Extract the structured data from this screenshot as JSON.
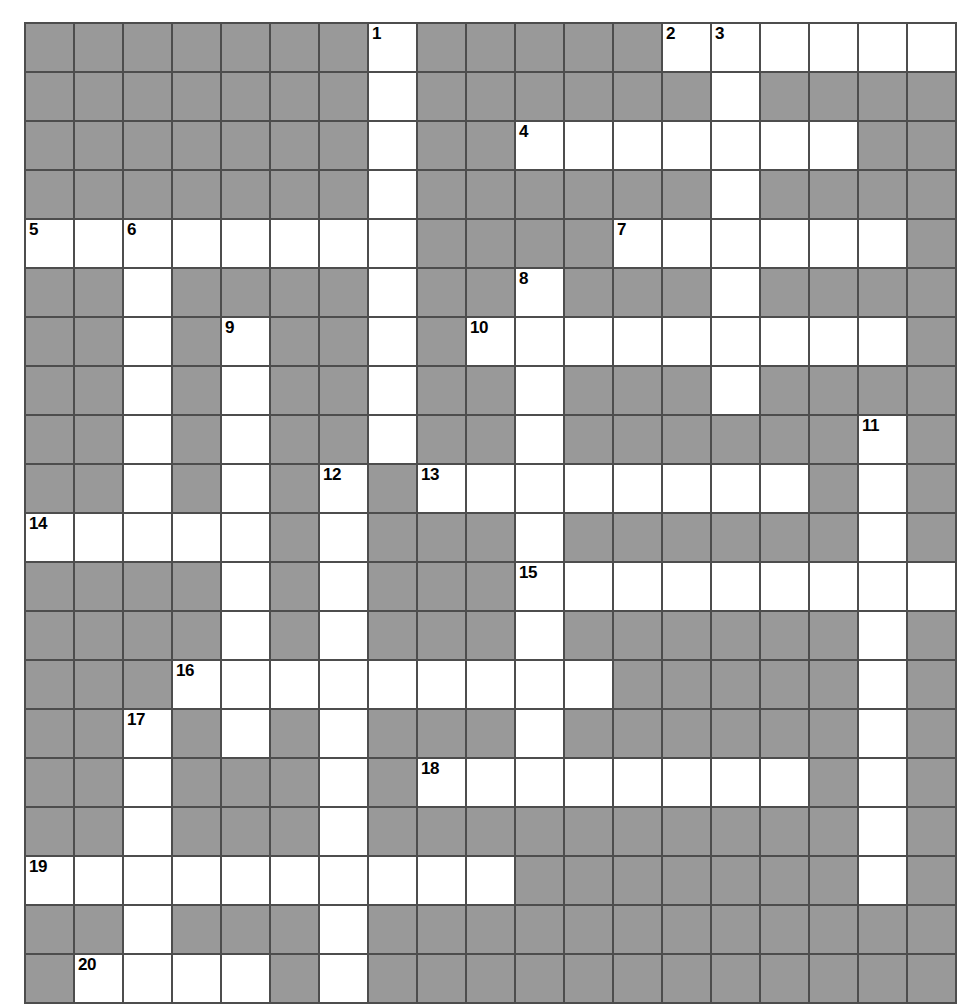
{
  "puzzle": {
    "type": "crossword-grid",
    "title": "Crossword puzzle grid",
    "columns": 19,
    "rows": 20,
    "cell_size": 49,
    "colors": {
      "block": "#999999",
      "open": "#ffffff",
      "grid_line": "#4d4d4d",
      "number": "#000000",
      "page_background": "#ffffff"
    },
    "open_cells": [
      [
        1,
        8
      ],
      [
        1,
        14
      ],
      [
        1,
        15
      ],
      [
        1,
        16
      ],
      [
        1,
        17
      ],
      [
        1,
        18
      ],
      [
        1,
        19
      ],
      [
        2,
        8
      ],
      [
        2,
        15
      ],
      [
        3,
        8
      ],
      [
        3,
        11
      ],
      [
        3,
        12
      ],
      [
        3,
        13
      ],
      [
        3,
        14
      ],
      [
        3,
        15
      ],
      [
        3,
        16
      ],
      [
        3,
        17
      ],
      [
        4,
        8
      ],
      [
        4,
        15
      ],
      [
        5,
        1
      ],
      [
        5,
        2
      ],
      [
        5,
        3
      ],
      [
        5,
        4
      ],
      [
        5,
        5
      ],
      [
        5,
        6
      ],
      [
        5,
        7
      ],
      [
        5,
        8
      ],
      [
        5,
        13
      ],
      [
        5,
        14
      ],
      [
        5,
        15
      ],
      [
        5,
        16
      ],
      [
        5,
        17
      ],
      [
        5,
        18
      ],
      [
        6,
        3
      ],
      [
        6,
        8
      ],
      [
        6,
        11
      ],
      [
        6,
        15
      ],
      [
        7,
        3
      ],
      [
        7,
        5
      ],
      [
        7,
        8
      ],
      [
        7,
        10
      ],
      [
        7,
        11
      ],
      [
        7,
        12
      ],
      [
        7,
        13
      ],
      [
        7,
        14
      ],
      [
        7,
        15
      ],
      [
        7,
        16
      ],
      [
        7,
        17
      ],
      [
        7,
        18
      ],
      [
        8,
        3
      ],
      [
        8,
        5
      ],
      [
        8,
        8
      ],
      [
        8,
        11
      ],
      [
        8,
        15
      ],
      [
        9,
        3
      ],
      [
        9,
        5
      ],
      [
        9,
        8
      ],
      [
        9,
        11
      ],
      [
        9,
        18
      ],
      [
        10,
        3
      ],
      [
        10,
        5
      ],
      [
        10,
        7
      ],
      [
        10,
        9
      ],
      [
        10,
        10
      ],
      [
        10,
        11
      ],
      [
        10,
        12
      ],
      [
        10,
        13
      ],
      [
        10,
        14
      ],
      [
        10,
        15
      ],
      [
        10,
        16
      ],
      [
        10,
        18
      ],
      [
        11,
        1
      ],
      [
        11,
        2
      ],
      [
        11,
        3
      ],
      [
        11,
        4
      ],
      [
        11,
        5
      ],
      [
        11,
        7
      ],
      [
        11,
        11
      ],
      [
        11,
        18
      ],
      [
        12,
        5
      ],
      [
        12,
        7
      ],
      [
        12,
        11
      ],
      [
        12,
        12
      ],
      [
        12,
        13
      ],
      [
        12,
        14
      ],
      [
        12,
        15
      ],
      [
        12,
        16
      ],
      [
        12,
        17
      ],
      [
        12,
        18
      ],
      [
        12,
        19
      ],
      [
        13,
        5
      ],
      [
        13,
        7
      ],
      [
        13,
        11
      ],
      [
        13,
        18
      ],
      [
        14,
        4
      ],
      [
        14,
        5
      ],
      [
        14,
        6
      ],
      [
        14,
        7
      ],
      [
        14,
        8
      ],
      [
        14,
        9
      ],
      [
        14,
        10
      ],
      [
        14,
        11
      ],
      [
        14,
        12
      ],
      [
        14,
        18
      ],
      [
        15,
        3
      ],
      [
        15,
        5
      ],
      [
        15,
        7
      ],
      [
        15,
        11
      ],
      [
        15,
        18
      ],
      [
        16,
        3
      ],
      [
        16,
        7
      ],
      [
        16,
        9
      ],
      [
        16,
        10
      ],
      [
        16,
        11
      ],
      [
        16,
        12
      ],
      [
        16,
        13
      ],
      [
        16,
        14
      ],
      [
        16,
        15
      ],
      [
        16,
        16
      ],
      [
        16,
        18
      ],
      [
        17,
        3
      ],
      [
        17,
        7
      ],
      [
        17,
        18
      ],
      [
        18,
        1
      ],
      [
        18,
        2
      ],
      [
        18,
        3
      ],
      [
        18,
        4
      ],
      [
        18,
        5
      ],
      [
        18,
        6
      ],
      [
        18,
        7
      ],
      [
        18,
        8
      ],
      [
        18,
        9
      ],
      [
        18,
        10
      ],
      [
        18,
        18
      ],
      [
        19,
        3
      ],
      [
        19,
        7
      ],
      [
        20,
        2
      ],
      [
        20,
        3
      ],
      [
        20,
        4
      ],
      [
        20,
        5
      ],
      [
        20,
        7
      ]
    ],
    "numbers": [
      {
        "number": "1",
        "row": 1,
        "col": 8
      },
      {
        "number": "2",
        "row": 1,
        "col": 14
      },
      {
        "number": "3",
        "row": 1,
        "col": 15
      },
      {
        "number": "4",
        "row": 3,
        "col": 11
      },
      {
        "number": "5",
        "row": 5,
        "col": 1
      },
      {
        "number": "6",
        "row": 5,
        "col": 3
      },
      {
        "number": "7",
        "row": 5,
        "col": 13
      },
      {
        "number": "8",
        "row": 6,
        "col": 11
      },
      {
        "number": "9",
        "row": 7,
        "col": 5
      },
      {
        "number": "10",
        "row": 7,
        "col": 10
      },
      {
        "number": "11",
        "row": 9,
        "col": 18
      },
      {
        "number": "12",
        "row": 10,
        "col": 7
      },
      {
        "number": "13",
        "row": 10,
        "col": 9
      },
      {
        "number": "14",
        "row": 11,
        "col": 1
      },
      {
        "number": "15",
        "row": 12,
        "col": 11
      },
      {
        "number": "16",
        "row": 14,
        "col": 4
      },
      {
        "number": "17",
        "row": 15,
        "col": 3
      },
      {
        "number": "18",
        "row": 16,
        "col": 9
      },
      {
        "number": "19",
        "row": 18,
        "col": 1
      },
      {
        "number": "20",
        "row": 20,
        "col": 2
      }
    ]
  }
}
